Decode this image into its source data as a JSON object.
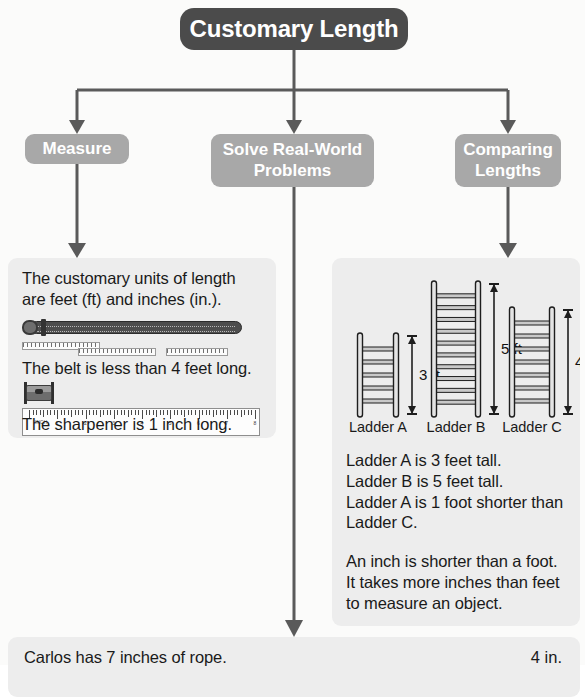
{
  "title": {
    "label": "Customary Length"
  },
  "categories": [
    {
      "id": "measure",
      "label": "Measure"
    },
    {
      "id": "solve",
      "label": "Solve Real-World\nProblems"
    },
    {
      "id": "compare",
      "label": "Comparing\nLengths"
    }
  ],
  "measure_panel": {
    "intro": "The customary units of length are feet (ft) and inches (in.).",
    "belt_caption": "The belt is less than 4 feet long.",
    "sharpener_caption": "The sharpener is 1 inch long.",
    "belt_icon": "belt-icon",
    "sharpener_icon": "pencil-sharpener-icon",
    "ruler_icon": "ruler-icon",
    "ruler_unit": "INCH",
    "ruler_numbers": [
      "1",
      "2",
      "3",
      "4",
      "5",
      "6",
      "7",
      "8"
    ]
  },
  "compare_panel": {
    "ladders": [
      {
        "name": "Ladder A",
        "measure": "3 ft",
        "height_ft": 3,
        "rungs": 5
      },
      {
        "name": "Ladder B",
        "measure": "5 ft",
        "height_ft": 5,
        "rungs": 10
      },
      {
        "name": "Ladder C",
        "measure": "4 ft",
        "height_ft": 4,
        "rungs": 7
      }
    ],
    "facts": [
      "Ladder A is 3 feet tall.",
      "Ladder B is 5 feet tall.",
      "Ladder A is 1 foot shorter than Ladder C."
    ],
    "note": [
      "An inch is shorter than a foot.",
      "It takes more inches than feet to measure an object."
    ]
  },
  "bottom_panel": {
    "text": "Carlos has 7 inches of rope.",
    "right_text": "4 in."
  },
  "colors": {
    "title_bg": "#4b4b4b",
    "category_bg": "#a8a8a8",
    "panel_bg": "#ededed",
    "connector": "#5a5a5a",
    "text": "#1a1a1a"
  },
  "chart_data": {
    "type": "bar",
    "categories": [
      "Ladder A",
      "Ladder B",
      "Ladder C"
    ],
    "values": [
      3,
      5,
      4
    ],
    "xlabel": "",
    "ylabel": "Height (ft)",
    "ylim": [
      0,
      5
    ],
    "data_labels": [
      "3 ft",
      "5 ft",
      "4 ft"
    ]
  }
}
